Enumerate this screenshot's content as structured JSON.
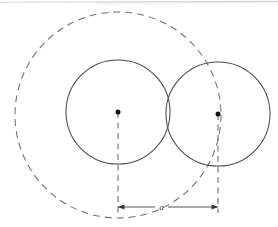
{
  "figure": {
    "background_color": "#ffffff",
    "width": 278,
    "height": 227,
    "stroke_color": "#4a4a50",
    "dashed_stroke_color": "#6e6e76",
    "dot_color": "#111111",
    "scan_edge_color": "#b8b8bc",
    "elements": {
      "circle_left": {
        "name": "left-circle",
        "cx": 118,
        "cy": 112,
        "r": 52,
        "style": "solid"
      },
      "circle_right": {
        "name": "right-circle",
        "cx": 218,
        "cy": 114,
        "r": 52,
        "style": "solid"
      },
      "circle_outer": {
        "name": "outer-construction-circle",
        "cx": 118,
        "cy": 115,
        "r": 103,
        "style": "dashed"
      },
      "center_dot_left": {
        "name": "left-center-point",
        "cx": 118,
        "cy": 112,
        "r": 2.4
      },
      "center_dot_right": {
        "name": "right-center-point",
        "cx": 218,
        "cy": 114,
        "r": 2.4
      },
      "leader_left": {
        "name": "left-leader-line",
        "x": 118,
        "y1": 112,
        "y2": 212,
        "style": "dashed"
      },
      "leader_right": {
        "name": "right-leader-line",
        "x": 218,
        "y1": 114,
        "y2": 212,
        "style": "dashed"
      },
      "dimension_line": {
        "name": "distance-dimension",
        "y": 207,
        "x1": 118,
        "x2": 218,
        "label": "a",
        "label_x": 161,
        "label_y": 206,
        "arrow_size": 4.5
      }
    }
  },
  "labels": {
    "distance": "a"
  }
}
